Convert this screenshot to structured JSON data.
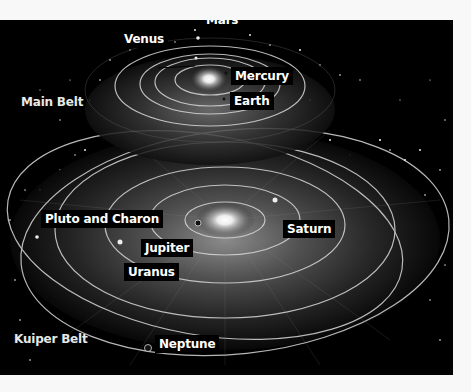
{
  "diagram": {
    "inner_system": {
      "labels": {
        "mars": "Mars",
        "venus": "Venus",
        "mercury": "Mercury",
        "earth": "Earth"
      },
      "region_label": "Main Belt"
    },
    "outer_system": {
      "labels": {
        "pluto": "Pluto and Charon",
        "saturn": "Saturn",
        "jupiter": "Jupiter",
        "uranus": "Uranus",
        "neptune": "Neptune"
      },
      "region_label": "Kuiper Belt"
    },
    "colors": {
      "background": "#000000",
      "orbit": "#d8d8d8",
      "label_bg": "#000000",
      "label_text": "#ffffff",
      "page": "#f8f8f8"
    }
  }
}
